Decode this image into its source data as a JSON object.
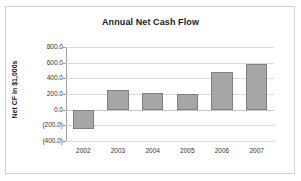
{
  "chart_data": {
    "type": "bar",
    "title": "Annual Net Cash Flow",
    "xlabel": "",
    "ylabel": "Net CF in $1,000s",
    "categories": [
      "2002",
      "2003",
      "2004",
      "2005",
      "2006",
      "2007"
    ],
    "values": [
      -250,
      250,
      215,
      205,
      475,
      580
    ],
    "series": [
      {
        "name": "Net CF",
        "values": [
          -250,
          250,
          215,
          205,
          475,
          580
        ]
      }
    ],
    "ylim": [
      -400,
      800
    ],
    "ytick_values": [
      800,
      600,
      400,
      200,
      0,
      -200,
      -400
    ],
    "ytick_labels": [
      "800.0",
      "600.0",
      "400.0",
      "200.0",
      "0.0",
      "(200.0)",
      "(400.0)"
    ],
    "grid": true,
    "legend": false,
    "bar_color": "#a6a6a6",
    "bar_border_color": "#7f7f7f",
    "gridline_color": "#d9d9d9",
    "background_color": "#ffffff",
    "frame_color": "#d3d3d3"
  }
}
